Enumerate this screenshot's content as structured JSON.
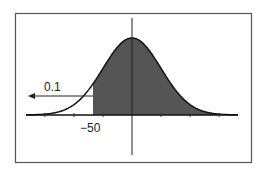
{
  "chart_data": {
    "type": "area",
    "title": "",
    "annotations": [
      {
        "text": "0.1",
        "target": "left tail area",
        "arrow": "left"
      },
      {
        "text": "-50",
        "position": "x-axis at shading boundary"
      }
    ],
    "x_marker": -50,
    "tail_probability": 0.1,
    "shaded_region": "x > -50",
    "grid": false,
    "legend": null
  },
  "labels": {
    "tail": "0.1",
    "cutoff": "−50"
  }
}
